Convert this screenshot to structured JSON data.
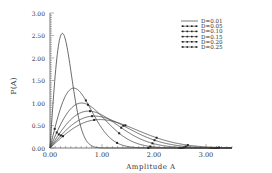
{
  "chart_data": {
    "type": "line",
    "title": "",
    "xlabel": "Amplitude A",
    "ylabel": "P(A)",
    "xlim": [
      0,
      3.5
    ],
    "ylim": [
      0,
      3.0
    ],
    "x_ticks": [
      "0.00",
      "1.00",
      "2.00",
      "3.00"
    ],
    "y_ticks": [
      "0.00",
      "0.50",
      "1.00",
      "1.50",
      "2.00",
      "2.50",
      "3.00"
    ],
    "grid": false,
    "legend_position": "upper right",
    "series": [
      {
        "name": "D=0.01",
        "sigma": 0.238,
        "peak_A": 0.24,
        "peak_P": 2.55,
        "marker": "none"
      },
      {
        "name": "D=0.05",
        "sigma": 0.456,
        "peak_A": 0.46,
        "peak_P": 1.33,
        "marker": "dot"
      },
      {
        "name": "D=0.10",
        "sigma": 0.607,
        "peak_A": 0.61,
        "peak_P": 1.0,
        "marker": "dot"
      },
      {
        "name": "D=0.15",
        "sigma": 0.74,
        "peak_A": 0.74,
        "peak_P": 0.82,
        "marker": "dot"
      },
      {
        "name": "D=0.20",
        "sigma": 0.855,
        "peak_A": 0.86,
        "peak_P": 0.71,
        "marker": "dot"
      },
      {
        "name": "D=0.25",
        "sigma": 0.96,
        "peak_A": 0.96,
        "peak_P": 0.63,
        "marker": "dot"
      }
    ]
  }
}
